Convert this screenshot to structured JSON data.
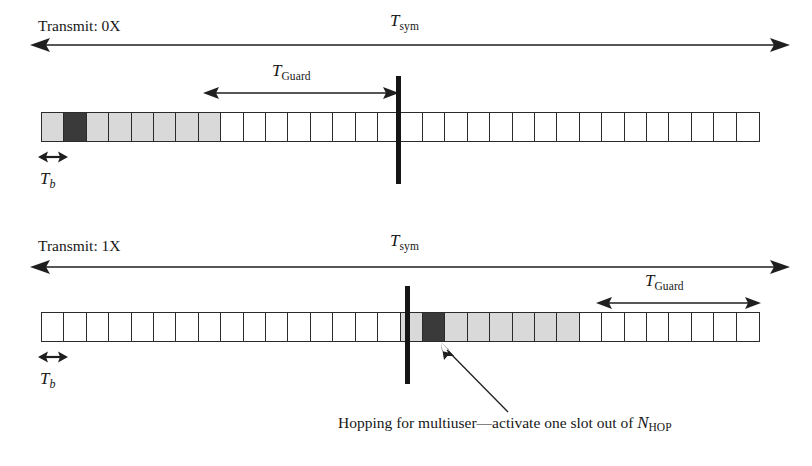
{
  "figure": {
    "type": "timing-diagram"
  },
  "panels": [
    {
      "id": "panel-0x",
      "transmit_label": "Transmit: 0X",
      "tsym": {
        "base": "T",
        "sub": "sym"
      },
      "tguard": {
        "base": "T",
        "sub": "Guard"
      },
      "tb": {
        "base": "T",
        "sub": "b"
      },
      "slots": {
        "total": 32,
        "before_divider": 16,
        "after_divider": 16,
        "shaded_run_start": 1,
        "shaded_run_length": 8,
        "active_slot_index": 2
      }
    },
    {
      "id": "panel-1x",
      "transmit_label": "Transmit: 1X",
      "tsym": {
        "base": "T",
        "sub": "sym"
      },
      "tguard": {
        "base": "T",
        "sub": "Guard"
      },
      "tb": {
        "base": "T",
        "sub": "b"
      },
      "slots": {
        "total": 32,
        "before_divider": 16,
        "after_divider": 16,
        "shaded_run_start": 17,
        "shaded_run_length": 8,
        "active_slot_index": 18
      }
    }
  ],
  "annotation": {
    "text_before": "Hopping for multiuser—activate one slot out of ",
    "symbol_base": "N",
    "symbol_sub": "HOP"
  },
  "colors": {
    "slot_shaded": "#d9d9d9",
    "slot_active": "#3a3a3a",
    "slot_blank": "#ffffff",
    "stroke": "#2b2b2b",
    "divider": "#151515",
    "text": "#171717",
    "background": "#ffffff"
  }
}
